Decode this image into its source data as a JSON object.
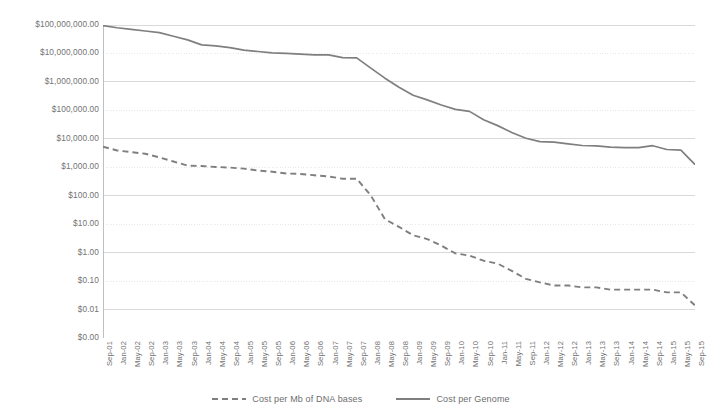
{
  "chart_data": {
    "type": "line",
    "title": "",
    "xlabel": "",
    "ylabel": "",
    "yscale": "log",
    "ylim": [
      0.001,
      100000000
    ],
    "grid": true,
    "legend_position": "bottom",
    "ytick_labels": [
      "$100,000,000.00",
      "$10,000,000.00",
      "$1,000,000.00",
      "$100,000.00",
      "$10,000.00",
      "$1,000.00",
      "$100.00",
      "$10.00",
      "$1.00",
      "$0.10",
      "$0.01",
      "$0.00"
    ],
    "ytick_values": [
      100000000,
      10000000,
      1000000,
      100000,
      10000,
      1000,
      100,
      10,
      1,
      0.1,
      0.01,
      0.001
    ],
    "categories": [
      "Sep-01",
      "Jan-02",
      "May-02",
      "Sep-02",
      "Jan-03",
      "May-03",
      "Sep-03",
      "Jan-04",
      "May-04",
      "Sep-04",
      "Jan-05",
      "May-05",
      "Sep-05",
      "Jan-06",
      "May-06",
      "Sep-06",
      "Jan-07",
      "May-07",
      "Sep-07",
      "Jan-08",
      "May-08",
      "Sep-08",
      "Jan-09",
      "May-09",
      "Sep-09",
      "Jan-10",
      "May-10",
      "Sep-10",
      "Jan-11",
      "May-11",
      "Sep-11",
      "Jan-12",
      "May-12",
      "Sep-12",
      "Jan-13",
      "May-13",
      "Sep-13",
      "Jan-14",
      "May-14",
      "Sep-14",
      "Jan-15",
      "May-15",
      "Sep-15"
    ],
    "series": [
      {
        "name": "Cost per Mb of DNA bases",
        "style": "dashed",
        "color": "#7f7f7f",
        "values": [
          5292.39,
          3898.64,
          3413.8,
          2986.2,
          2230.98,
          1598.91,
          1135.7,
          1107.46,
          1028.5,
          974.16,
          897.76,
          766.73,
          699.2,
          605.0,
          581.9,
          522.71,
          475.89,
          395.0,
          397.09,
          102.13,
          15.03,
          8.0,
          4.08,
          3.0,
          1.77,
          0.94,
          0.79,
          0.52,
          0.41,
          0.23,
          0.12,
          0.09,
          0.07,
          0.07,
          0.06,
          0.06,
          0.05,
          0.05,
          0.05,
          0.05,
          0.04,
          0.04,
          0.014
        ]
      },
      {
        "name": "Cost per Genome",
        "style": "solid",
        "color": "#7f7f7f",
        "values": [
          95263072,
          80000000,
          70175437,
          61448422,
          53751684,
          40157554,
          30000000,
          20000000,
          18519312,
          16000000,
          13000000,
          11732535,
          10474556,
          10000000,
          9408739,
          8925000,
          8927342,
          7147571,
          7000000,
          3063820,
          1352982,
          654000,
          340000,
          232735,
          154714,
          108065,
          92233,
          46774,
          29092,
          16712,
          10497,
          7950,
          7666,
          6618,
          5826,
          5671,
          5096,
          4920,
          4905,
          5731,
          4211,
          4008,
          1245
        ]
      }
    ]
  },
  "legend": {
    "entries": [
      {
        "label": "Cost per Mb of DNA bases",
        "style": "dashed"
      },
      {
        "label": "Cost per Genome",
        "style": "solid"
      }
    ]
  },
  "colors": {
    "line": "#7f7f7f",
    "grid_major": "#d9d9d9",
    "grid_minor": "#e8e8e8",
    "axis": "#bfbfbf",
    "text": "#6d6d6d",
    "background": "#ffffff"
  }
}
